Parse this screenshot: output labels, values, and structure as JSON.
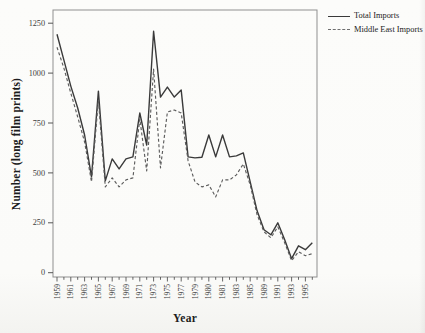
{
  "chart_data": {
    "type": "line",
    "title": "",
    "xlabel": "Year",
    "ylabel": "Number (long film prints)",
    "n_points": 38,
    "tick_label_every": 2,
    "x_tick_labels": [
      "1959",
      "1961",
      "1963",
      "1965",
      "1967",
      "1969",
      "1971",
      "1973",
      "1975",
      "1977",
      "1979",
      "1980",
      "1981",
      "1983",
      "1985",
      "1989",
      "1991",
      "1993",
      "1995"
    ],
    "y_ticks": [
      0,
      250,
      500,
      750,
      1000,
      1250
    ],
    "y_tick_labels": [
      "0",
      "250",
      "500",
      "750",
      "1000",
      "1250"
    ],
    "ylim": [
      0,
      1250
    ],
    "grid": false,
    "legend_position": "top-right-outside",
    "series": [
      {
        "name": "Total Imports",
        "style": "solid",
        "color": "#3a3a3a",
        "values": [
          1195,
          1065,
          935,
          825,
          690,
          480,
          910,
          460,
          570,
          520,
          570,
          580,
          800,
          640,
          1210,
          880,
          930,
          880,
          915,
          580,
          575,
          578,
          690,
          580,
          690,
          580,
          585,
          600,
          455,
          310,
          215,
          190,
          250,
          165,
          70,
          135,
          115,
          150
        ]
      },
      {
        "name": "Middle East Imports",
        "style": "dashed",
        "color": "#5c5c5c",
        "values": [
          1130,
          1025,
          900,
          780,
          655,
          455,
          865,
          430,
          475,
          430,
          465,
          475,
          770,
          510,
          1020,
          525,
          805,
          815,
          800,
          560,
          455,
          430,
          440,
          380,
          465,
          465,
          490,
          545,
          440,
          290,
          205,
          175,
          230,
          150,
          60,
          105,
          85,
          95
        ]
      }
    ]
  },
  "legend": {
    "items": [
      {
        "label": "Total Imports"
      },
      {
        "label": "Middle East Imports"
      }
    ]
  }
}
